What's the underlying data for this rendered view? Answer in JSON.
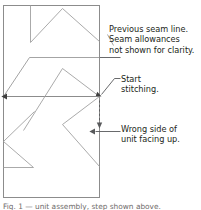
{
  "figure": {
    "colors": {
      "outline": "#8c8c8c",
      "seam_line": "#9a9a9a",
      "patch_line": "#a0a0a0",
      "leader": "#58595b",
      "text": "#231f20",
      "caption_text": "#6f6c6b",
      "background": "#ffffff"
    },
    "annotations": [
      {
        "name": "previous-seam-line",
        "lines": [
          "Previous seam line.",
          "Seam allowances",
          "not shown for clarity."
        ]
      },
      {
        "name": "start-stitching",
        "lines": [
          "Start",
          "stitching."
        ]
      },
      {
        "name": "wrong-side",
        "lines": [
          "Wrong side of",
          "unit facing up."
        ]
      }
    ],
    "caption_clipped": "Fig. 1 — unit assembly, step shown above."
  }
}
